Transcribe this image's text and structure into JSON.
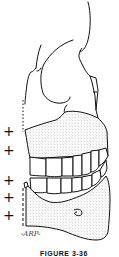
{
  "figure": {
    "caption": "FIGURE 3-36",
    "signature": "-ARP-",
    "markers": [
      {
        "symbol": "+",
        "x": 3,
        "y": 131
      },
      {
        "symbol": "+",
        "x": 3,
        "y": 150
      },
      {
        "symbol": "+",
        "x": 3,
        "y": 180
      },
      {
        "symbol": "+",
        "x": 3,
        "y": 197
      },
      {
        "symbol": "+",
        "x": 3,
        "y": 215
      }
    ],
    "colors": {
      "line": "#111111",
      "stipple": "#9a9a9a",
      "background": "#ffffff"
    }
  }
}
